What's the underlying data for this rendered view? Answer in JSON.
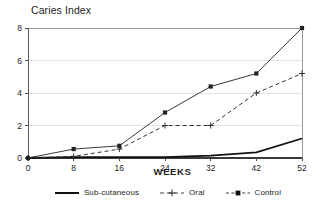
{
  "chart_data": {
    "type": "line",
    "title": "Caries Index",
    "xlabel": "WEEKS",
    "ylabel": "Caries Index",
    "x": [
      0,
      8,
      16,
      24,
      32,
      42,
      52
    ],
    "xtick_labels": [
      "0",
      "8",
      "16",
      "24",
      "32",
      "42",
      "52"
    ],
    "ytick_labels": [
      "0",
      "2",
      "4",
      "6",
      "8"
    ],
    "yticks": [
      0,
      2,
      4,
      6,
      8
    ],
    "ylim": [
      0,
      8
    ],
    "grid": "horizontal",
    "legend_position": "bottom",
    "series": [
      {
        "name": "Sub-cutaneous",
        "values": [
          0,
          0.05,
          0.05,
          0.05,
          0.15,
          0.35,
          1.2
        ],
        "style": "solid-thick",
        "marker": "none",
        "color": "#111111"
      },
      {
        "name": "Oral",
        "values": [
          0,
          0.1,
          0.55,
          2.0,
          2.0,
          4.0,
          5.2
        ],
        "style": "dashed",
        "marker": "plus",
        "color": "#333333"
      },
      {
        "name": "Control",
        "values": [
          0,
          0.55,
          0.75,
          2.8,
          4.4,
          5.2,
          8.0
        ],
        "style": "solid",
        "marker": "square",
        "color": "#222222"
      }
    ]
  },
  "legend": {
    "items": [
      {
        "label": "Sub-cutaneous"
      },
      {
        "label": "Oral"
      },
      {
        "label": "Control"
      }
    ]
  }
}
